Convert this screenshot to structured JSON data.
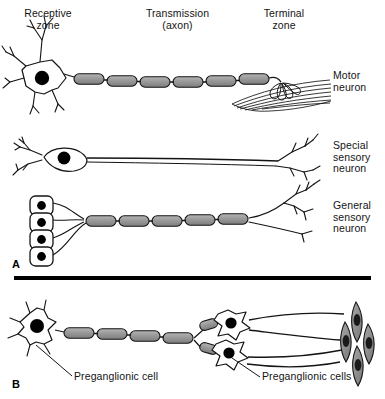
{
  "figure": {
    "title_zones": {
      "receptive": "Receptive\nzone",
      "transmission": "Transmission\n(axon)",
      "terminal": "Terminal\nzone"
    },
    "panels": [
      {
        "letter": "A",
        "name": "somatic-neurons-panel",
        "rows": [
          {
            "label": "Motor\nneuron",
            "cell_type": "multipolar-motor-neuron",
            "receptive": "branching dendrites on stellate soma",
            "soma": "multipolar white soma with black nucleus",
            "axon": "myelinated axon, 6 internode segments",
            "terminal": "motor end plate on skeletal muscle fibers"
          },
          {
            "label": "Special\nsensory\nneuron",
            "cell_type": "bipolar-sensory-neuron",
            "receptive": "small dendritic tuft",
            "soma": "spindle-shaped soma with black nucleus",
            "axon": "long unmyelinated axon",
            "terminal": "branched central terminal"
          },
          {
            "label": "General\nsensory\nneuron",
            "cell_type": "pseudounipolar-sensory-neuron",
            "receptive": "four encapsulated receptor cell bodies",
            "soma": "four rounded ganglion cells with black nuclei",
            "axon": "myelinated axon, 5 internode segments",
            "terminal": "free branching nerve endings"
          }
        ]
      },
      {
        "letter": "B",
        "name": "autonomic-neurons-panel",
        "annotations": [
          {
            "text": "Preganglionic cell",
            "target": "left-preganglionic-soma"
          },
          {
            "text": "Preganglionic cells",
            "target": "ganglion-cell-cluster"
          }
        ],
        "elements": {
          "preganglionic": "stellate soma with black nucleus and myelinated axon",
          "ganglion_cells": "two stellate postganglionic cells",
          "effector": "smooth muscle cells with dark nuclei"
        }
      }
    ],
    "colors": {
      "ink": "#141414",
      "myelin_fill": "#9a9a9a",
      "soma_fill": "#ffffff",
      "nucleus": "#000000",
      "muscle_fill": "#8d8d8d",
      "background": "#ffffff",
      "divider": "#000000"
    }
  }
}
